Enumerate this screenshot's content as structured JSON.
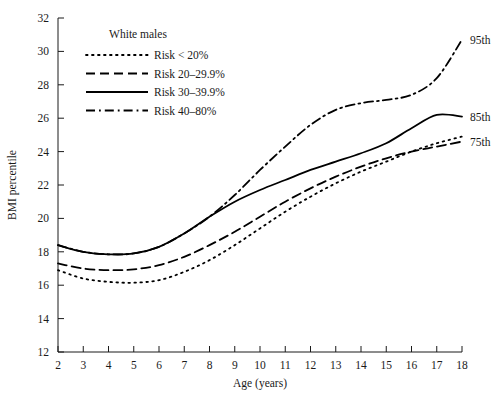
{
  "chart_data": {
    "type": "line",
    "title": "",
    "legend_title": "White males",
    "xlabel": "Age (years)",
    "ylabel": "BMI percentile",
    "xlim": [
      2,
      18
    ],
    "ylim": [
      12,
      32
    ],
    "xticks": [
      2,
      3,
      4,
      5,
      6,
      7,
      8,
      9,
      10,
      11,
      12,
      13,
      14,
      15,
      16,
      17,
      18
    ],
    "yticks": [
      12,
      14,
      16,
      18,
      20,
      22,
      24,
      26,
      28,
      30,
      32
    ],
    "grid": false,
    "legend_position": "upper-left-inside",
    "x": [
      2,
      3,
      4,
      5,
      6,
      7,
      8,
      9,
      10,
      11,
      12,
      13,
      14,
      15,
      16,
      17,
      18
    ],
    "series": [
      {
        "name": "Risk < 20%",
        "label": "Risk < 20%",
        "style": "dotted",
        "end_label": "",
        "values": [
          16.9,
          16.4,
          16.2,
          16.15,
          16.3,
          16.8,
          17.5,
          18.4,
          19.4,
          20.4,
          21.3,
          22.1,
          22.8,
          23.4,
          24.0,
          24.5,
          24.9
        ]
      },
      {
        "name": "Risk 20-29.9%",
        "label": "Risk 20–29.9%",
        "style": "dashed",
        "end_label": "75th",
        "values": [
          17.3,
          17.0,
          16.9,
          16.95,
          17.2,
          17.7,
          18.4,
          19.2,
          20.1,
          21.0,
          21.8,
          22.5,
          23.1,
          23.6,
          24.0,
          24.3,
          24.6
        ]
      },
      {
        "name": "Risk 30-39.9%",
        "label": "Risk 30–39.9%",
        "style": "solid",
        "end_label": "85th",
        "values": [
          18.4,
          18.0,
          17.85,
          17.9,
          18.3,
          19.1,
          20.1,
          21.0,
          21.7,
          22.3,
          22.9,
          23.4,
          23.9,
          24.5,
          25.4,
          26.2,
          26.1
        ]
      },
      {
        "name": "Risk 40-80%",
        "label": "Risk 40–80%",
        "style": "dashdot",
        "end_label": "95th",
        "values": [
          18.4,
          18.0,
          17.85,
          17.9,
          18.3,
          19.1,
          20.1,
          21.4,
          22.9,
          24.3,
          25.6,
          26.5,
          26.9,
          27.1,
          27.4,
          28.4,
          30.7
        ]
      }
    ]
  }
}
